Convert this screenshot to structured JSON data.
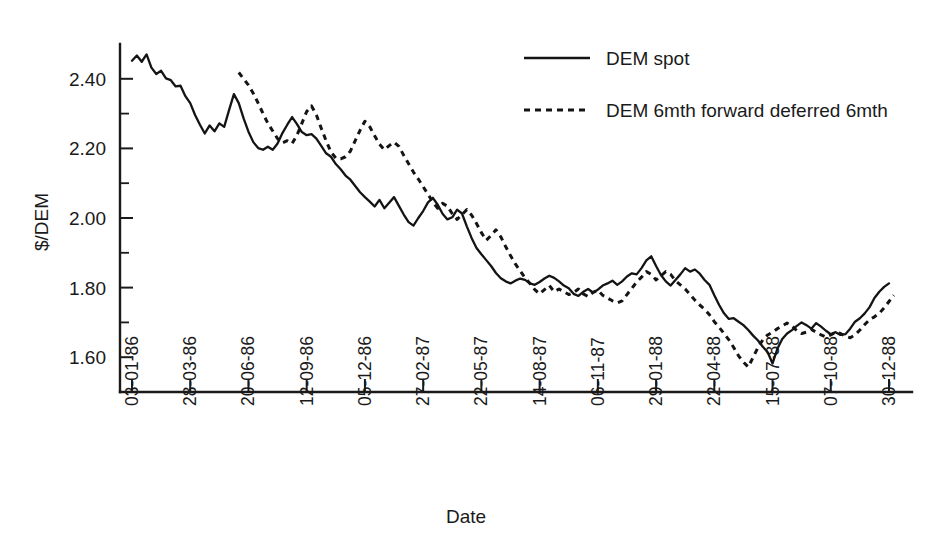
{
  "chart_data": {
    "type": "line",
    "title": "",
    "xlabel": "Date",
    "ylabel": "$/DEM",
    "ylim": [
      1.5,
      2.5
    ],
    "yticks": [
      1.6,
      1.8,
      2.0,
      2.2,
      2.4
    ],
    "ytick_labels": [
      "1.60",
      "1.80",
      "2.00",
      "2.20",
      "2.40"
    ],
    "yticks_minor": [
      1.7,
      1.9,
      2.1,
      2.3
    ],
    "grid": false,
    "legend_position": "top-right",
    "xtick_labels": [
      "03-01-86",
      "28-03-86",
      "20-06-86",
      "12-09-86",
      "05-12-86",
      "27-02-87",
      "22-05-87",
      "14-08-87",
      "06-11-87",
      "29-01-88",
      "22-04-88",
      "15-07-88",
      "07-10-88",
      "30-12-88"
    ],
    "x_index_of_ticks": [
      0,
      12,
      24,
      36,
      48,
      60,
      72,
      84,
      96,
      108,
      120,
      132,
      144,
      156
    ],
    "x_total_points": 157,
    "series": [
      {
        "name": "DEM spot",
        "style": "solid",
        "start_index": 0,
        "values": [
          2.452,
          2.467,
          2.449,
          2.47,
          2.432,
          2.414,
          2.423,
          2.401,
          2.396,
          2.378,
          2.38,
          2.35,
          2.33,
          2.296,
          2.268,
          2.243,
          2.266,
          2.249,
          2.272,
          2.262,
          2.31,
          2.356,
          2.33,
          2.286,
          2.248,
          2.218,
          2.201,
          2.196,
          2.205,
          2.196,
          2.214,
          2.244,
          2.268,
          2.29,
          2.27,
          2.247,
          2.238,
          2.241,
          2.228,
          2.207,
          2.186,
          2.176,
          2.155,
          2.14,
          2.122,
          2.11,
          2.092,
          2.074,
          2.06,
          2.047,
          2.033,
          2.052,
          2.028,
          2.044,
          2.06,
          2.035,
          2.01,
          1.988,
          1.978,
          2.0,
          2.02,
          2.045,
          2.058,
          2.038,
          2.012,
          1.996,
          2.002,
          2.024,
          2.013,
          1.976,
          1.942,
          1.914,
          1.896,
          1.879,
          1.862,
          1.842,
          1.827,
          1.818,
          1.812,
          1.82,
          1.826,
          1.822,
          1.812,
          1.808,
          1.816,
          1.826,
          1.834,
          1.828,
          1.818,
          1.806,
          1.798,
          1.782,
          1.776,
          1.788,
          1.796,
          1.786,
          1.794,
          1.806,
          1.812,
          1.82,
          1.808,
          1.818,
          1.832,
          1.841,
          1.838,
          1.856,
          1.878,
          1.89,
          1.862,
          1.836,
          1.818,
          1.806,
          1.822,
          1.838,
          1.856,
          1.846,
          1.852,
          1.84,
          1.822,
          1.808,
          1.778,
          1.75,
          1.726,
          1.71,
          1.712,
          1.702,
          1.692,
          1.678,
          1.662,
          1.648,
          1.63,
          1.614,
          1.582,
          1.624,
          1.652,
          1.668,
          1.678,
          1.69,
          1.7,
          1.692,
          1.682,
          1.698,
          1.688,
          1.676,
          1.666,
          1.672,
          1.664,
          1.666,
          1.682,
          1.702,
          1.712,
          1.726,
          1.744,
          1.77,
          1.788,
          1.802,
          1.812
        ]
      },
      {
        "name": "DEM 6mth forward deferred 6mth",
        "style": "dashed",
        "start_index": 22,
        "values": [
          2.418,
          2.4,
          2.382,
          2.358,
          2.33,
          2.3,
          2.272,
          2.25,
          2.228,
          2.216,
          2.222,
          2.214,
          2.238,
          2.272,
          2.306,
          2.322,
          2.296,
          2.258,
          2.222,
          2.19,
          2.172,
          2.17,
          2.176,
          2.192,
          2.222,
          2.252,
          2.278,
          2.262,
          2.236,
          2.212,
          2.196,
          2.208,
          2.218,
          2.206,
          2.18,
          2.156,
          2.132,
          2.112,
          2.09,
          2.068,
          2.046,
          2.028,
          2.042,
          2.034,
          2.012,
          1.996,
          2.01,
          2.024,
          2.008,
          1.984,
          1.958,
          1.936,
          1.95,
          1.966,
          1.946,
          1.918,
          1.892,
          1.868,
          1.848,
          1.828,
          1.812,
          1.794,
          1.782,
          1.794,
          1.806,
          1.788,
          1.796,
          1.788,
          1.78,
          1.786,
          1.796,
          1.782,
          1.774,
          1.786,
          1.792,
          1.778,
          1.77,
          1.762,
          1.756,
          1.762,
          1.78,
          1.798,
          1.816,
          1.83,
          1.846,
          1.838,
          1.822,
          1.834,
          1.846,
          1.838,
          1.82,
          1.808,
          1.796,
          1.78,
          1.764,
          1.75,
          1.738,
          1.722,
          1.702,
          1.686,
          1.668,
          1.65,
          1.628,
          1.604,
          1.586,
          1.572,
          1.6,
          1.628,
          1.65,
          1.664,
          1.672,
          1.682,
          1.69,
          1.698,
          1.69,
          1.676,
          1.668,
          1.672,
          1.68,
          1.672,
          1.664,
          1.658,
          1.664,
          1.672,
          1.668,
          1.66,
          1.656,
          1.664,
          1.678,
          1.694,
          1.708,
          1.716,
          1.726,
          1.742,
          1.76,
          1.778
        ]
      }
    ]
  },
  "legend": {
    "entries": [
      {
        "label": "DEM spot",
        "style": "solid"
      },
      {
        "label": "DEM 6mth forward deferred 6mth",
        "style": "dashed"
      }
    ]
  },
  "axes": {
    "y_title": "$/DEM",
    "x_title": "Date"
  }
}
